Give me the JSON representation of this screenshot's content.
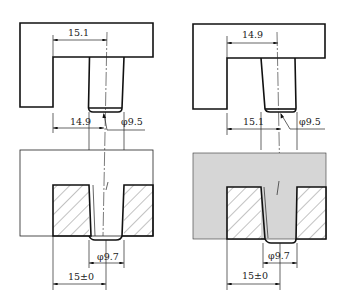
{
  "figure": {
    "colors": {
      "line": "#111111",
      "background": "#ffffff",
      "shaded_block": "#d6d6d6"
    }
  },
  "left_view": {
    "top": {
      "upper_dim": "15.1",
      "lower_dim": "14.9",
      "pin_diameter": "φ9.5"
    },
    "bottom": {
      "hole_diameter": "φ9.7",
      "position_dim": "15±0",
      "shaded": false
    }
  },
  "right_view": {
    "top": {
      "upper_dim": "14.9",
      "lower_dim": "15.1",
      "pin_diameter": "φ9.5"
    },
    "bottom": {
      "hole_diameter": "φ9.7",
      "position_dim": "15±0",
      "shaded": true
    }
  }
}
